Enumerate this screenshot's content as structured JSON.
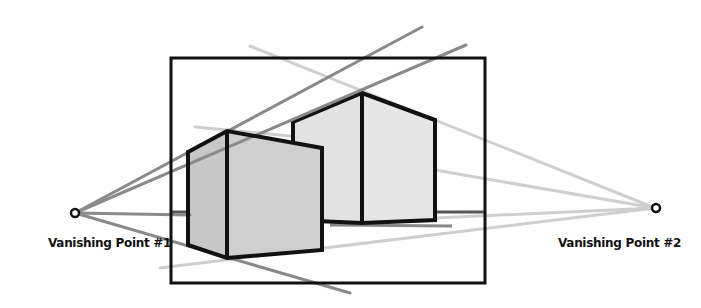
{
  "diagram": {
    "vanishing_points": [
      {
        "id": "vp1",
        "label": "Vanishing Point #1",
        "x": 75,
        "y": 213
      },
      {
        "id": "vp2",
        "label": "Vanishing Point #2",
        "x": 655,
        "y": 208
      }
    ],
    "colors": {
      "outline": "#111111",
      "vp1_lines": "#8a8a8a",
      "vp2_lines": "#cfcfcf",
      "near_box_fill": "#cdcdcd",
      "back_box_fill": "#e4e4e4",
      "background": "#ffffff"
    }
  }
}
